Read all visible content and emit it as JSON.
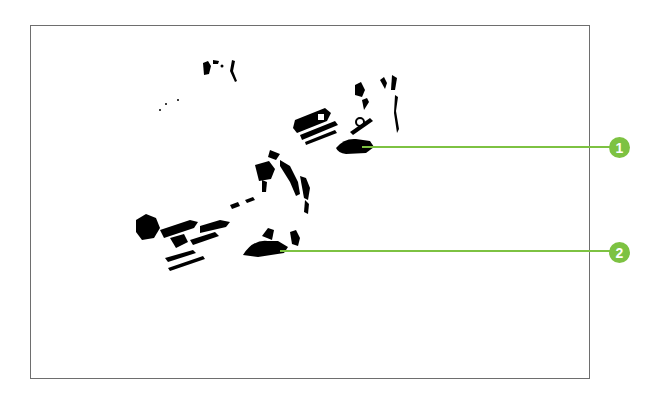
{
  "diagram": {
    "type": "callout illustration",
    "frame": {
      "border_color": "#6e6e6e"
    },
    "accent_color": "#7dc242",
    "callouts": [
      {
        "number": "1",
        "label": "1",
        "anchor": {
          "x": 362,
          "y": 147
        },
        "circle_center": {
          "x": 620,
          "y": 147
        }
      },
      {
        "number": "2",
        "label": "2",
        "anchor": {
          "x": 280,
          "y": 251
        },
        "circle_center": {
          "x": 620,
          "y": 252
        }
      }
    ]
  }
}
